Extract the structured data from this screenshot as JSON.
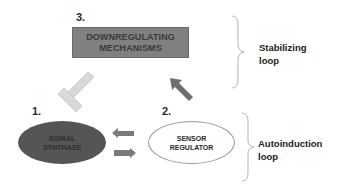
{
  "diagram": {
    "nodes": [
      {
        "id": "downregulating",
        "number": "3.",
        "lines": [
          "DOWNREGULATING",
          "MECHANISMS"
        ],
        "shape": "rectangle",
        "fill": "#808080"
      },
      {
        "id": "signal_synthase",
        "number": "1.",
        "lines": [
          "SIGNAL",
          "SYNTHASE"
        ],
        "shape": "ellipse",
        "fill": "#555555"
      },
      {
        "id": "sensor_regulator",
        "number": "2.",
        "lines": [
          "SENSOR",
          "REGULATOR"
        ],
        "shape": "ellipse",
        "fill": "#ffffff"
      }
    ],
    "edges": [
      {
        "from": "downregulating",
        "to": "signal_synthase",
        "type": "inhibition",
        "color": "#d8d8d8"
      },
      {
        "from": "sensor_regulator",
        "to": "downregulating",
        "type": "activation",
        "color": "#707070"
      },
      {
        "from": "sensor_regulator",
        "to": "signal_synthase",
        "type": "activation",
        "color": "#7a7a7a"
      },
      {
        "from": "signal_synthase",
        "to": "sensor_regulator",
        "type": "activation",
        "color": "#7a7a7a"
      }
    ],
    "brackets": [
      {
        "label_lines": [
          "Stabilizing",
          "loop"
        ]
      },
      {
        "label_lines": [
          "Autoinduction",
          "loop"
        ]
      }
    ]
  }
}
